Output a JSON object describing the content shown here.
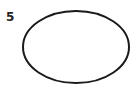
{
  "figure": {
    "label": "5",
    "shape": "ellipse",
    "stroke_color": "#1a1a1a",
    "fill_color": "#ffffff",
    "ellipse": {
      "cx": 76,
      "cy": 47,
      "rx": 53,
      "ry": 36
    }
  }
}
